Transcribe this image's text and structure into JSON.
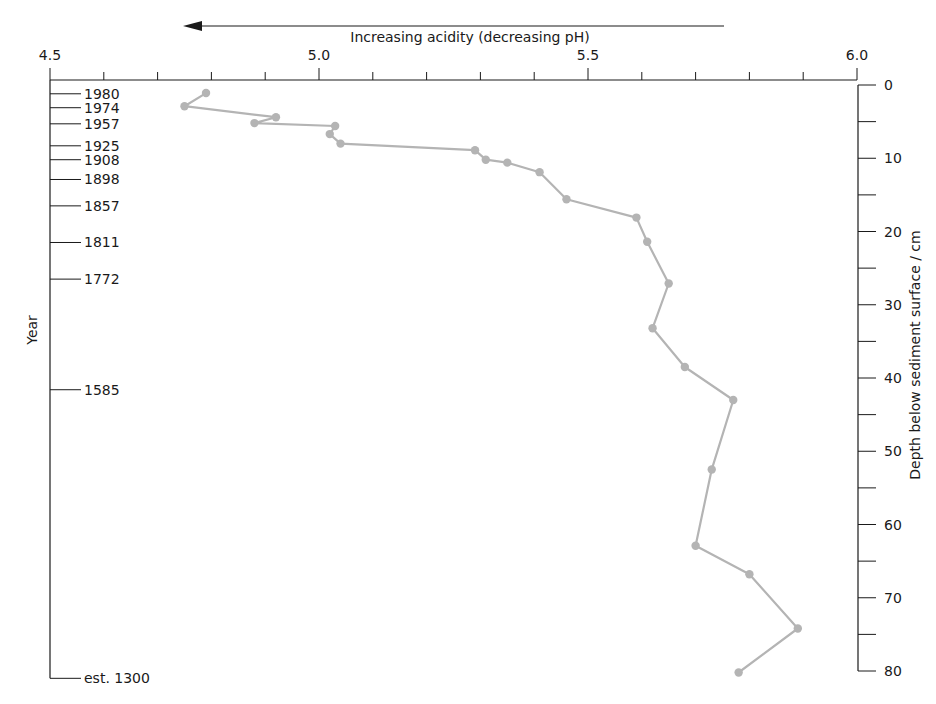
{
  "chart_data": {
    "type": "line",
    "title": "",
    "xlabel": "Increasing acidity (decreasing pH)",
    "ylabel_left": "Year",
    "ylabel_right": "Depth below sediment surface / cm",
    "xlim": [
      4.5,
      6.0
    ],
    "ylim": [
      0,
      80
    ],
    "x_axis_position": "top",
    "x_ticks_major": [
      4.5,
      5.0,
      5.5,
      6.0
    ],
    "x_tick_labels": [
      "4.5",
      "5.0",
      "5.5",
      "6.0"
    ],
    "x_minor_step": 0.1,
    "depth_ticks_major": [
      0,
      10,
      20,
      30,
      40,
      50,
      60,
      70,
      80
    ],
    "depth_tick_labels": [
      "0",
      "10",
      "20",
      "30",
      "40",
      "50",
      "60",
      "70",
      "80"
    ],
    "depth_minor_step": 5,
    "year_ticks": [
      {
        "label": "1980",
        "depth": 1.2
      },
      {
        "label": "1974",
        "depth": 3.1
      },
      {
        "label": "1957",
        "depth": 5.3
      },
      {
        "label": "1925",
        "depth": 8.3
      },
      {
        "label": "1908",
        "depth": 10.2
      },
      {
        "label": "1898",
        "depth": 12.9
      },
      {
        "label": "1857",
        "depth": 16.5
      },
      {
        "label": "1811",
        "depth": 21.5
      },
      {
        "label": "1772",
        "depth": 26.5
      },
      {
        "label": "1585",
        "depth": 41.6
      },
      {
        "label": "est. 1300",
        "depth": 81.0
      }
    ],
    "annotation": {
      "text": "Increasing acidity (decreasing pH)",
      "arrow_direction": "left"
    },
    "grid": false,
    "legend": null,
    "series": [
      {
        "name": "pH",
        "color": "#b4b4b4",
        "points": [
          {
            "ph": 4.79,
            "depth": 1.1
          },
          {
            "ph": 4.75,
            "depth": 2.9
          },
          {
            "ph": 4.92,
            "depth": 4.4
          },
          {
            "ph": 4.88,
            "depth": 5.2
          },
          {
            "ph": 5.03,
            "depth": 5.6
          },
          {
            "ph": 5.02,
            "depth": 6.7
          },
          {
            "ph": 5.04,
            "depth": 8.0
          },
          {
            "ph": 5.29,
            "depth": 8.9
          },
          {
            "ph": 5.31,
            "depth": 10.2
          },
          {
            "ph": 5.35,
            "depth": 10.6
          },
          {
            "ph": 5.41,
            "depth": 11.9
          },
          {
            "ph": 5.46,
            "depth": 15.6
          },
          {
            "ph": 5.59,
            "depth": 18.1
          },
          {
            "ph": 5.61,
            "depth": 21.4
          },
          {
            "ph": 5.65,
            "depth": 27.1
          },
          {
            "ph": 5.62,
            "depth": 33.2
          },
          {
            "ph": 5.68,
            "depth": 38.5
          },
          {
            "ph": 5.77,
            "depth": 43.0
          },
          {
            "ph": 5.73,
            "depth": 52.5
          },
          {
            "ph": 5.7,
            "depth": 62.9
          },
          {
            "ph": 5.8,
            "depth": 66.8
          },
          {
            "ph": 5.89,
            "depth": 74.2
          },
          {
            "ph": 5.78,
            "depth": 80.2
          }
        ]
      }
    ]
  },
  "colors": {
    "axis": "#1a1a1a",
    "series": "#b4b4b4"
  }
}
